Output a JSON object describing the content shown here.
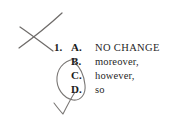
{
  "page": {
    "background_color": "#ffffff",
    "ink_color": "#6d6a68",
    "print_color": "#1b1b1b"
  },
  "question": {
    "number": "1.",
    "options": [
      {
        "letter": "A.",
        "text": "NO CHANGE"
      },
      {
        "letter": "B.",
        "text": "moreover,"
      },
      {
        "letter": "C.",
        "text": "however,"
      },
      {
        "letter": "D.",
        "text": "so"
      }
    ]
  },
  "annotations": {
    "cross_out_mark": "x-mark",
    "circled_options_mark": "oval-loop",
    "selected_mark": "check-mark"
  }
}
